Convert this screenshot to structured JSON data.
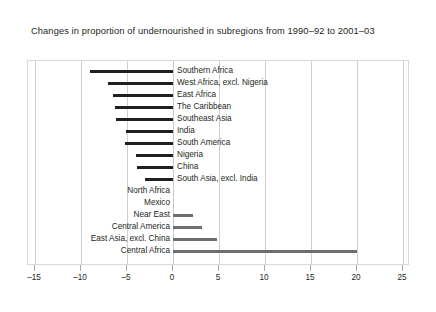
{
  "chart_data": {
    "type": "bar",
    "orientation": "horizontal",
    "title": "Changes in proportion of undernourished in subregions from 1990–92 to 2001–03",
    "xlabel": "",
    "ylabel": "",
    "xlim": [
      -15,
      25
    ],
    "xticks": [
      -15,
      -10,
      -5,
      0,
      5,
      10,
      15,
      20,
      25
    ],
    "xticklabels": [
      "–15",
      "–10",
      "–5",
      "0",
      "5",
      "10",
      "15",
      "20",
      "25"
    ],
    "grid": true,
    "legend": false,
    "categories": [
      "Southern Africa",
      "West Africa, excl. Nigeria",
      "East Africa",
      "The Caribbean",
      "Southeast Asia",
      "India",
      "South America",
      "Nigeria",
      "China",
      "South Asia, excl. India",
      "North Africa",
      "Mexico",
      "Near East",
      "Central America",
      "East Asia, excl. China",
      "Central Africa"
    ],
    "values": [
      -9.0,
      -7.1,
      -6.5,
      -6.3,
      -6.2,
      -5.1,
      -5.2,
      -4.0,
      -3.9,
      -3.0,
      0,
      0,
      2.2,
      3.2,
      4.8,
      20.0
    ]
  },
  "axis": {
    "tick_labels": [
      "–15",
      "–10",
      "–5",
      "0",
      "5",
      "10",
      "15",
      "20",
      "25"
    ]
  },
  "colors": {
    "bar_dark": "#231f20",
    "bar_grey": "#6d6e71",
    "grid": "#d0d0d0",
    "frame": "#d9d9d9",
    "text": "#231f20",
    "background": "#ffffff"
  }
}
